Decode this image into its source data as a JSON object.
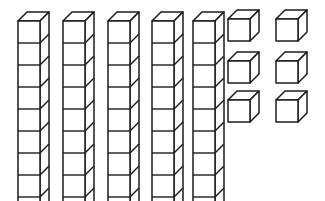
{
  "figure": {
    "background_color": "#ffffff",
    "line_color": "#1c1c1c",
    "face_color": "#ffffff"
  },
  "chart_data": {
    "type": "diagram",
    "model": "base-ten-blocks",
    "projection": "oblique",
    "groups": [
      {
        "name": "rods",
        "label": "tens rods",
        "count": 5,
        "cubes_per_item": 10,
        "value": 50
      },
      {
        "name": "units",
        "label": "unit cubes",
        "count": 6,
        "cubes_per_item": 1,
        "value": 6,
        "arrangement": {
          "columns": 2,
          "rows": 3
        }
      }
    ],
    "total_value": 56,
    "tens": 5,
    "ones": 6
  },
  "geometry": {
    "cube_size": 22,
    "depth_x": 9,
    "depth_y": 9,
    "rods": [
      {
        "id": "rod-1",
        "x": 18,
        "y": 21,
        "cubes": 10
      },
      {
        "id": "rod-2",
        "x": 63,
        "y": 21,
        "cubes": 10
      },
      {
        "id": "rod-3",
        "x": 108,
        "y": 21,
        "cubes": 10
      },
      {
        "id": "rod-4",
        "x": 152,
        "y": 21,
        "cubes": 10
      },
      {
        "id": "rod-5",
        "x": 193,
        "y": 21,
        "cubes": 10
      }
    ],
    "units": [
      {
        "id": "unit-1",
        "x": 228,
        "y": 19
      },
      {
        "id": "unit-2",
        "x": 276,
        "y": 19
      },
      {
        "id": "unit-3",
        "x": 228,
        "y": 61
      },
      {
        "id": "unit-4",
        "x": 276,
        "y": 61
      },
      {
        "id": "unit-5",
        "x": 228,
        "y": 100
      },
      {
        "id": "unit-6",
        "x": 276,
        "y": 100
      }
    ]
  }
}
